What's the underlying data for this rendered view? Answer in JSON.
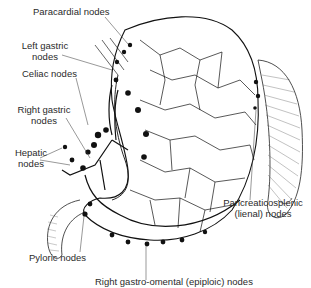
{
  "figure": {
    "style": "black and white line illustration",
    "colors": {
      "ink": "#111111",
      "text": "#2a2a2a",
      "background": "#ffffff"
    }
  },
  "labels": {
    "paracardial": "Paracardial nodes",
    "left_gastric_1": "Left gastric",
    "left_gastric_2": "nodes",
    "celiac": "Celiac nodes",
    "right_gastric_1": "Right gastric",
    "right_gastric_2": "nodes",
    "hepatic_1": "Hepatic",
    "hepatic_2": "nodes",
    "pyloric": "Pyloric nodes",
    "pancreaticosplenic_1": "Pancreaticosplenic",
    "pancreaticosplenic_2": "(lienal) nodes",
    "right_gastro_omental": "Right gastro-omental (epiploic) nodes"
  },
  "signature": "artist signature"
}
